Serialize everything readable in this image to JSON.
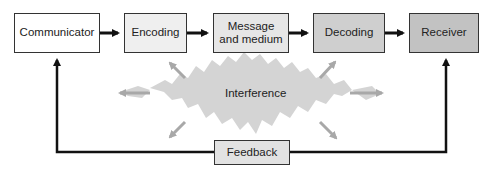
{
  "diagram": {
    "nodes": [
      {
        "id": "communicator",
        "label": "Communicator",
        "fill": "#ffffff"
      },
      {
        "id": "encoding",
        "label": "Encoding",
        "fill": "#efefef"
      },
      {
        "id": "message",
        "label": "Message\nand medium",
        "fill": "#e6e6e6"
      },
      {
        "id": "decoding",
        "label": "Decoding",
        "fill": "#cfcfcf"
      },
      {
        "id": "receiver",
        "label": "Receiver",
        "fill": "#c2c2c2"
      }
    ],
    "message_line1": "Message",
    "message_line2": "and medium",
    "interference": {
      "label": "Interference",
      "fill": "#d4d4d4",
      "arrow_color": "#a8a8a8"
    },
    "feedback": {
      "label": "Feedback",
      "fill": "#e2e2e2"
    },
    "edges": [
      {
        "from": "communicator",
        "to": "encoding"
      },
      {
        "from": "encoding",
        "to": "message"
      },
      {
        "from": "message",
        "to": "decoding"
      },
      {
        "from": "decoding",
        "to": "receiver"
      },
      {
        "from": "receiver",
        "to": "feedback"
      },
      {
        "from": "feedback",
        "to": "communicator"
      }
    ]
  }
}
